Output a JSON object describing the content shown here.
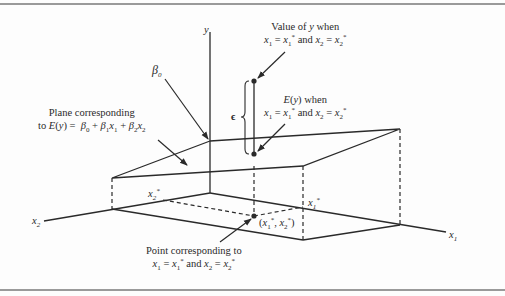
{
  "figure": {
    "type": "3d-regression-plane-diagram",
    "colors": {
      "line": "#2a2a2a",
      "rule": "#9a9a9a",
      "background": "#fdfdfd"
    },
    "axes": {
      "y_label": "y",
      "x1_label": "x1",
      "x2_label": "x2"
    },
    "labels": {
      "beta0": "β0",
      "epsilon": "ϵ",
      "value_of_y_line1": "Value of y when",
      "value_of_y_line2": "x1 = x1* and x2 = x2*",
      "expected_line1": "E(y) when",
      "expected_line2": "x1 = x1* and x2 = x2*",
      "plane_line1": "Plane corresponding",
      "plane_line2": "to E(y) = β0 + β1x1 + β2x2",
      "point_line1": "Point corresponding to",
      "point_line2": "x1 = x1* and x2 = x2*",
      "x1_star": "x1*",
      "x2_star": "x2*",
      "point_coords": "(x1*, x2*)"
    }
  }
}
